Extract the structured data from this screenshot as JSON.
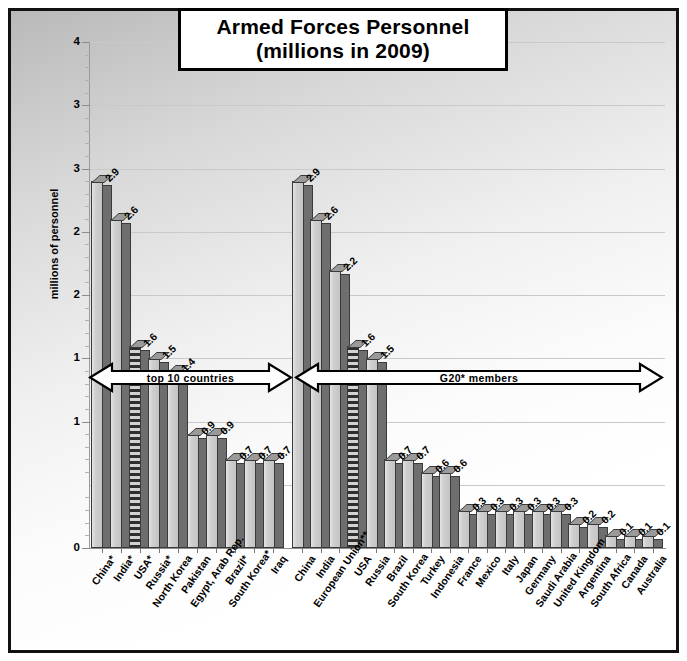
{
  "title": {
    "line1": "Armed Forces Personnel",
    "line2": "(millions in 2009)"
  },
  "axis": {
    "y_title": "millions of personnel",
    "y_tick_labels": [
      "4",
      "3",
      "3",
      "2",
      "2",
      "1",
      "1",
      "0"
    ],
    "y_tick_values": [
      4.0,
      3.5,
      3.0,
      2.5,
      2.0,
      1.5,
      1.0,
      0.0
    ]
  },
  "annotations": {
    "group1_arrow": "top 10 countries",
    "group2_arrow": "G20* members"
  },
  "colors": {
    "bar_face": "#cfcfcf",
    "bar_side": "#6e6e6e",
    "bar_outline": "#3a3a3a",
    "gridline": "#c9c9c9",
    "frame": "#111111",
    "background_top": "#b9b9b9",
    "background_bottom": "#ffffff",
    "highlight_bar_pattern": "#2e2e2e"
  },
  "chart_data": {
    "type": "bar",
    "title": "Armed Forces Personnel (millions in 2009)",
    "xlabel": "",
    "ylabel": "millions of personnel",
    "ylim": [
      0,
      4
    ],
    "grid": true,
    "legend": "none",
    "groups": [
      {
        "name": "top 10 countries",
        "categories": [
          "China*",
          "India*",
          "USA*",
          "Russia*",
          "North Korea",
          "Pakistan",
          "Egypt, Arab Rep.",
          "Brazil*",
          "South Korea*",
          "Iraq"
        ],
        "values": [
          2.9,
          2.6,
          1.6,
          1.5,
          1.4,
          0.9,
          0.9,
          0.7,
          0.7,
          0.7
        ],
        "labels": [
          "2.9",
          "2.6",
          "1.6",
          "1.5",
          "1.4",
          "0.9",
          "0.9",
          "0.7",
          "0.7",
          "0.7"
        ],
        "highlighted": [
          "USA*"
        ]
      },
      {
        "name": "G20* members",
        "categories": [
          "China",
          "India",
          "European Union**",
          "USA",
          "Russia",
          "Brazil",
          "South Korea",
          "Turkey",
          "Indonesia",
          "France",
          "Mexico",
          "Italy",
          "Japan",
          "Germany",
          "Saudi Arabia",
          "United Kingdom",
          "Argentina",
          "South Africa",
          "Canada",
          "Australia"
        ],
        "values": [
          2.9,
          2.6,
          2.2,
          1.6,
          1.5,
          0.7,
          0.7,
          0.6,
          0.6,
          0.3,
          0.3,
          0.3,
          0.3,
          0.3,
          0.3,
          0.2,
          0.2,
          0.1,
          0.1,
          0.1
        ],
        "labels": [
          "2.9",
          "2.6",
          "2.2",
          "1.6",
          "1.5",
          "0.7",
          "0.7",
          "0.6",
          "0.6",
          "0.3",
          "0.3",
          "0.3",
          "0.3",
          "0.3",
          "0.3",
          "0.2",
          "0.2",
          "0.1",
          "0.1",
          "0.1"
        ],
        "highlighted": [
          "USA"
        ]
      }
    ]
  }
}
